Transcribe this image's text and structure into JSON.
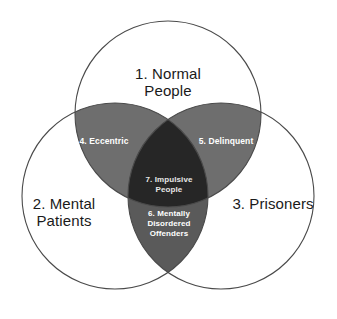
{
  "diagram": {
    "type": "venn",
    "set_count": 3,
    "background_color": "#ffffff",
    "outline_color": "#4a4a4a",
    "colors": {
      "pair_light": "#6e6e6e",
      "pair_dark": "#5a5a5a",
      "triple": "#262626",
      "set_label_text": "#1a1a1a",
      "region_label_text": "#ffffff"
    },
    "sets": [
      {
        "id": "normal-people",
        "number": "1.",
        "label": "1.  Normal\nPeople",
        "name": "Normal People",
        "position": "top"
      },
      {
        "id": "mental-patients",
        "number": "2.",
        "label": "2. Mental\nPatients",
        "name": "Mental Patients",
        "position": "bottom-left"
      },
      {
        "id": "prisoners",
        "number": "3.",
        "label": "3. Prisoners",
        "name": "Prisoners",
        "position": "bottom-right"
      }
    ],
    "intersections": [
      {
        "id": "eccentric",
        "number": "4.",
        "label": "4.  Eccentric",
        "name": "Eccentric",
        "sets": [
          "Normal People",
          "Mental Patients"
        ],
        "fill": "#6e6e6e"
      },
      {
        "id": "delinquent",
        "number": "5.",
        "label": "5.  Delinquent",
        "name": "Delinquent",
        "sets": [
          "Normal People",
          "Prisoners"
        ],
        "fill": "#6e6e6e"
      },
      {
        "id": "mentally-disordered-offenders",
        "number": "6.",
        "label": "6.  Mentally\nDisordered\nOffenders",
        "name": "Mentally Disordered Offenders",
        "sets": [
          "Mental Patients",
          "Prisoners"
        ],
        "fill": "#5a5a5a"
      },
      {
        "id": "impulsive-people",
        "number": "7.",
        "label": "7. Impulsive\nPeople",
        "name": "Impulsive People",
        "sets": [
          "Normal People",
          "Mental Patients",
          "Prisoners"
        ],
        "fill": "#262626"
      }
    ]
  }
}
